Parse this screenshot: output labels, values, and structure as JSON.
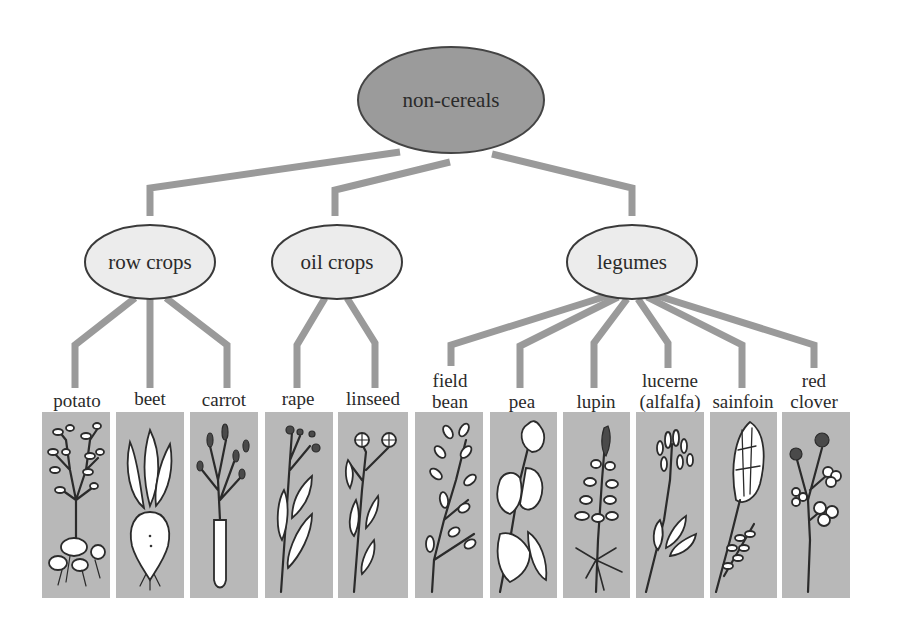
{
  "diagram": {
    "root": {
      "label": "non-cereals",
      "fill": "#9b9b9b"
    },
    "categories": [
      {
        "label": "row crops"
      },
      {
        "label": "oil crops"
      },
      {
        "label": "legumes"
      }
    ],
    "crops": [
      {
        "category": "row crops",
        "lines": [
          "potato"
        ],
        "illustration": "potato-plant"
      },
      {
        "category": "row crops",
        "lines": [
          "beet"
        ],
        "illustration": "beet-plant"
      },
      {
        "category": "row crops",
        "lines": [
          "carrot"
        ],
        "illustration": "carrot-plant"
      },
      {
        "category": "oil crops",
        "lines": [
          "rape"
        ],
        "illustration": "rape-plant"
      },
      {
        "category": "oil crops",
        "lines": [
          "linseed"
        ],
        "illustration": "linseed-plant"
      },
      {
        "category": "legumes",
        "lines": [
          "field",
          "bean"
        ],
        "illustration": "field-bean-plant"
      },
      {
        "category": "legumes",
        "lines": [
          "pea"
        ],
        "illustration": "pea-plant"
      },
      {
        "category": "legumes",
        "lines": [
          "lupin"
        ],
        "illustration": "lupin-plant"
      },
      {
        "category": "legumes",
        "lines": [
          "lucerne",
          "(alfalfa)"
        ],
        "illustration": "lucerne-plant"
      },
      {
        "category": "legumes",
        "lines": [
          "sainfoin"
        ],
        "illustration": "sainfoin-plant"
      },
      {
        "category": "legumes",
        "lines": [
          "red",
          "clover"
        ],
        "illustration": "red-clover-plant"
      }
    ],
    "colors": {
      "connector": "#9a9a9a",
      "category_fill": "#ececec",
      "panel": "#b8b8b8"
    }
  }
}
